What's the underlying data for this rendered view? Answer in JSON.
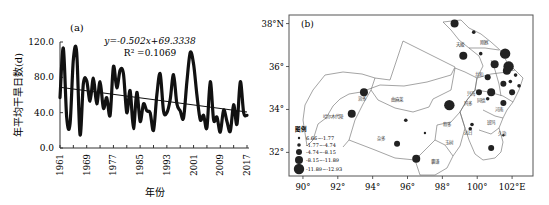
{
  "chart_data": [
    {
      "type": "line",
      "panel_label": "(a)",
      "title": "",
      "xlabel": "年份",
      "ylabel": "年平均干旱日数(d)",
      "ylim": [
        0,
        120
      ],
      "yticks": [
        "0.0",
        "40.0",
        "80.0",
        "120.0"
      ],
      "ytick_values": [
        0,
        40,
        80,
        120
      ],
      "xticks": [
        "1961",
        "1969",
        "1977",
        "1985",
        "1993",
        "2001",
        "2009",
        "2017"
      ],
      "xtick_values": [
        1961,
        1969,
        1977,
        1985,
        1993,
        2001,
        2009,
        2017
      ],
      "grid": false,
      "legend": null,
      "annotation_equation": "y=-0.502x+69.3338",
      "annotation_r2": "R² =0.1069",
      "series": [
        {
          "name": "年平均干旱日数",
          "x": [
            1961,
            1962,
            1963,
            1964,
            1965,
            1966,
            1967,
            1968,
            1969,
            1970,
            1971,
            1972,
            1973,
            1974,
            1975,
            1976,
            1977,
            1978,
            1979,
            1980,
            1981,
            1982,
            1983,
            1984,
            1985,
            1986,
            1987,
            1988,
            1989,
            1990,
            1991,
            1992,
            1993,
            1994,
            1995,
            1996,
            1997,
            1998,
            1999,
            2000,
            2001,
            2002,
            2003,
            2004,
            2005,
            2006,
            2007,
            2008,
            2009,
            2010,
            2011,
            2012,
            2013,
            2014,
            2015,
            2016,
            2017
          ],
          "values": [
            57,
            113,
            35,
            27,
            100,
            108,
            15,
            73,
            76,
            53,
            79,
            50,
            75,
            45,
            57,
            37,
            92,
            68,
            88,
            84,
            40,
            65,
            22,
            63,
            30,
            50,
            42,
            40,
            20,
            60,
            84,
            42,
            40,
            55,
            83,
            50,
            42,
            34,
            75,
            108,
            95,
            60,
            32,
            37,
            23,
            75,
            32,
            35,
            18,
            43,
            30,
            19,
            49,
            27,
            75,
            40,
            37
          ]
        },
        {
          "name": "trend",
          "type": "linear",
          "slope": -0.502,
          "intercept": 69.3338,
          "x": [
            1961,
            2017
          ],
          "values": [
            68.8,
            40.7
          ]
        }
      ]
    },
    {
      "type": "map",
      "panel_label": "(b)",
      "xticks": [
        "90°",
        "92°",
        "94°",
        "96°",
        "98°",
        "100°",
        "102°E"
      ],
      "xtick_values": [
        90,
        92,
        94,
        96,
        98,
        100,
        102
      ],
      "yticks": [
        "32°",
        "34°",
        "36°",
        "38°N"
      ],
      "ytick_values": [
        32,
        34,
        36,
        38
      ],
      "xlim": [
        89.2,
        103.2
      ],
      "ylim": [
        30.9,
        38.4
      ],
      "legend": {
        "title": "图例",
        "position": "lower-left",
        "entries": [
          {
            "label": "6.66~-1.77",
            "size": 1
          },
          {
            "label": "-1.77~-4.74",
            "size": 2
          },
          {
            "label": "-4.74~-8.15",
            "size": 3
          },
          {
            "label": "-8.15~-11.89",
            "size": 4
          },
          {
            "label": "-11.89~-12.93",
            "size": 5
          }
        ]
      },
      "region_labels": [
        "治多",
        "曲麻莱",
        "哈尔木代陵",
        "杂多",
        "囊谦",
        "玉树",
        "称多",
        "玛多",
        "久治",
        "班玛",
        "达日",
        "同德",
        "兴海",
        "共和",
        "天峻",
        "刚察",
        "河南"
      ],
      "stations": [
        {
          "lon": 98.7,
          "lat": 38.0,
          "size": 4
        },
        {
          "lon": 99.8,
          "lat": 37.6,
          "size": 2
        },
        {
          "lon": 99.2,
          "lat": 36.5,
          "size": 4
        },
        {
          "lon": 100.2,
          "lat": 36.6,
          "size": 2
        },
        {
          "lon": 101.0,
          "lat": 36.1,
          "size": 4
        },
        {
          "lon": 101.6,
          "lat": 36.6,
          "size": 5
        },
        {
          "lon": 101.8,
          "lat": 36.0,
          "size": 5
        },
        {
          "lon": 101.7,
          "lat": 35.8,
          "size": 4
        },
        {
          "lon": 102.2,
          "lat": 35.6,
          "size": 2
        },
        {
          "lon": 100.6,
          "lat": 35.5,
          "size": 3
        },
        {
          "lon": 101.5,
          "lat": 35.2,
          "size": 3
        },
        {
          "lon": 101.9,
          "lat": 35.3,
          "size": 2
        },
        {
          "lon": 102.4,
          "lat": 35.1,
          "size": 2
        },
        {
          "lon": 102.0,
          "lat": 34.8,
          "size": 3
        },
        {
          "lon": 100.1,
          "lat": 34.8,
          "size": 3
        },
        {
          "lon": 100.8,
          "lat": 34.8,
          "size": 4
        },
        {
          "lon": 100.6,
          "lat": 34.5,
          "size": 2
        },
        {
          "lon": 101.5,
          "lat": 34.3,
          "size": 3
        },
        {
          "lon": 98.4,
          "lat": 34.2,
          "size": 5
        },
        {
          "lon": 99.7,
          "lat": 33.3,
          "size": 2
        },
        {
          "lon": 99.6,
          "lat": 33.1,
          "size": 2
        },
        {
          "lon": 100.8,
          "lat": 32.2,
          "size": 3
        },
        {
          "lon": 101.5,
          "lat": 32.8,
          "size": 1
        },
        {
          "lon": 93.5,
          "lat": 34.8,
          "size": 4
        },
        {
          "lon": 92.8,
          "lat": 33.8,
          "size": 4
        },
        {
          "lon": 95.9,
          "lat": 33.5,
          "size": 2
        },
        {
          "lon": 95.4,
          "lat": 32.4,
          "size": 3
        },
        {
          "lon": 96.5,
          "lat": 31.7,
          "size": 4
        },
        {
          "lon": 97.0,
          "lat": 32.9,
          "size": 1
        }
      ]
    }
  ]
}
